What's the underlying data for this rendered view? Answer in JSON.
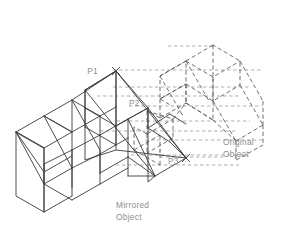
{
  "figure": {
    "kind": "isometric-cad-mirror-illustration",
    "background_color": "#ffffff",
    "line_color": "#3a3a3a",
    "hidden_line_color": "#555555",
    "projection_line_color": "#8d8d8d",
    "label_color": "#8e8e8e"
  },
  "labels": {
    "p1": "P1",
    "p2": "P2",
    "p3": "P3",
    "mirrored_line1": "Mirrored",
    "mirrored_line2": "Object",
    "original_line1": "Original",
    "original_line2": "Object"
  },
  "points": {
    "p1": {
      "x": 116,
      "y": 71,
      "label_x": 98,
      "label_y": 71
    },
    "p2": {
      "x": 148,
      "y": 108,
      "label_x": 129,
      "label_y": 103
    },
    "p3": {
      "x": 186,
      "y": 158,
      "label_x": 168,
      "label_y": 161
    }
  },
  "geometry": {
    "mirrored_object_outline": "M 18 133 L 18 198 L 74 227 L 74 227 L 74 163 Z",
    "note": "stair-stepped wedge solid drawn with continuous lines on the left",
    "original_object_outline": "dashed mirrored copy on the right",
    "mirror_plane": "M 116 71 L 186 158 L 155 176 L 85 90 Z"
  },
  "legend": {
    "solid_means": "Mirrored Object",
    "dashed_means": "Original Object"
  }
}
